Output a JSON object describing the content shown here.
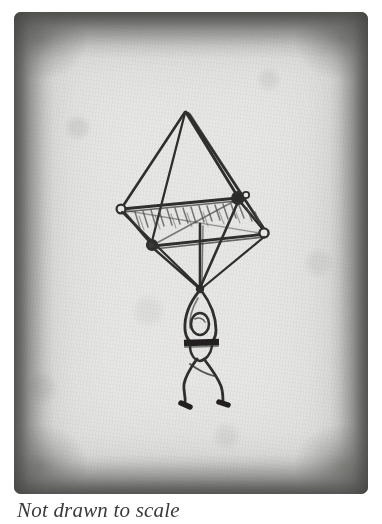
{
  "page": {
    "background_color": "#ffffff",
    "width": 382,
    "height": 524
  },
  "photo": {
    "name": "historic-sketch-photograph",
    "paper_color": "#e7e7e5",
    "ink_color": "#2b2b2b",
    "edge_color": "#484846",
    "subject": "pyramidal parachute with suspended figure",
    "alt_text": "Hand-drawn sketch of a pyramid-shaped parachute canopy with a person hanging from its suspension lines"
  },
  "drawing": {
    "canopy": {
      "name": "pyramid-parachute-canopy",
      "apex": [
        171,
        100
      ],
      "nodes": {
        "left": [
          107,
          196
        ],
        "rear_right": [
          224,
          185
        ],
        "front_right": [
          252,
          221
        ],
        "front_left": [
          138,
          233
        ]
      },
      "hatching_strokes": 16
    },
    "rigging": {
      "name": "suspension-lines",
      "convergence_point": [
        186,
        276
      ],
      "line_count": 4
    },
    "figure": {
      "name": "hanging-figure",
      "head_and_arms_loop": true,
      "belt_y": 330,
      "feet": [
        [
          171,
          396
        ],
        [
          209,
          392
        ]
      ]
    }
  },
  "caption": {
    "text": "Not drawn to scale",
    "color": "#3a3a3a",
    "style": "italic-serif"
  }
}
